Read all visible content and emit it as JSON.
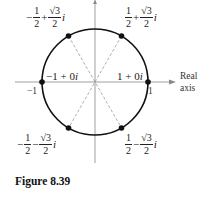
{
  "figure": {
    "caption": "Figure 8.39",
    "axis_label_line1": "Real",
    "axis_label_line2": "axis",
    "tick_left": "−1",
    "tick_right": "1",
    "points": [
      {
        "id": "p1",
        "sign": "",
        "num": "1",
        "den": "2",
        "op": "+",
        "sqrt_num": "√3",
        "sqrt_den": "2",
        "i": "i"
      },
      {
        "id": "p2",
        "sign": "−",
        "num": "1",
        "den": "2",
        "op": "+",
        "sqrt_num": "√3",
        "sqrt_den": "2",
        "i": "i"
      },
      {
        "id": "p3",
        "sign": "−",
        "num": "1",
        "den": "2",
        "op": "−",
        "sqrt_num": "√3",
        "sqrt_den": "2",
        "i": "i"
      },
      {
        "id": "p4",
        "sign": "",
        "num": "1",
        "den": "2",
        "op": "−",
        "sqrt_num": "√3",
        "sqrt_den": "2",
        "i": "i"
      }
    ],
    "label_neg1": "−1 + 0",
    "label_pos1": "1 + 0",
    "imag": "i",
    "colors": {
      "line": "#111111",
      "axis": "#888888",
      "dashed": "#999999"
    }
  }
}
